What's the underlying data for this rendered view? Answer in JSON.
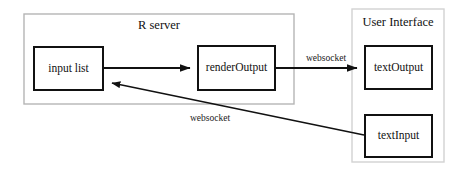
{
  "diagram": {
    "background": "#ffffff",
    "stroke_dark": "#1a1a1a",
    "stroke_light": "#c9c9c9",
    "containers": [
      {
        "id": "r-server",
        "label": "R server",
        "x": 24,
        "y": 14,
        "width": 270,
        "height": 90,
        "border_color": "#b5b5b5",
        "label_x": 159,
        "label_y": 26
      },
      {
        "id": "user-interface",
        "label": "User Interface",
        "x": 352,
        "y": 9,
        "width": 92,
        "height": 153,
        "border_color": "#d2d2d2",
        "label_x": 398,
        "label_y": 23
      }
    ],
    "nodes": [
      {
        "id": "input-list",
        "label": "input list",
        "x": 34,
        "y": 47,
        "width": 69,
        "height": 43,
        "label_x": 68.5,
        "label_y": 69
      },
      {
        "id": "render-output",
        "label": "renderOutput",
        "x": 198,
        "y": 46,
        "width": 77,
        "height": 44,
        "label_x": 236.5,
        "label_y": 68
      },
      {
        "id": "text-output",
        "label": "textOutput",
        "x": 365,
        "y": 46,
        "width": 67,
        "height": 43,
        "label_x": 398.5,
        "label_y": 68
      },
      {
        "id": "text-input",
        "label": "textInput",
        "x": 365,
        "y": 115,
        "width": 67,
        "height": 42,
        "label_x": 398.5,
        "label_y": 136
      }
    ],
    "edges": [
      {
        "id": "input-list-to-render-output",
        "from": "input list",
        "to": "renderOutput",
        "label": "",
        "path": "M 104 68 L 194 68"
      },
      {
        "id": "render-output-to-text-output",
        "from": "renderOutput",
        "to": "textOutput",
        "label": "websocket",
        "label_x": 326,
        "label_y": 59,
        "path": "M 276 68 L 361 68"
      },
      {
        "id": "text-input-to-input-list",
        "from": "textInput",
        "to": "input list",
        "label": "websocket",
        "label_x": 210,
        "label_y": 119,
        "path": "M 364 135 L 107 81"
      }
    ]
  }
}
